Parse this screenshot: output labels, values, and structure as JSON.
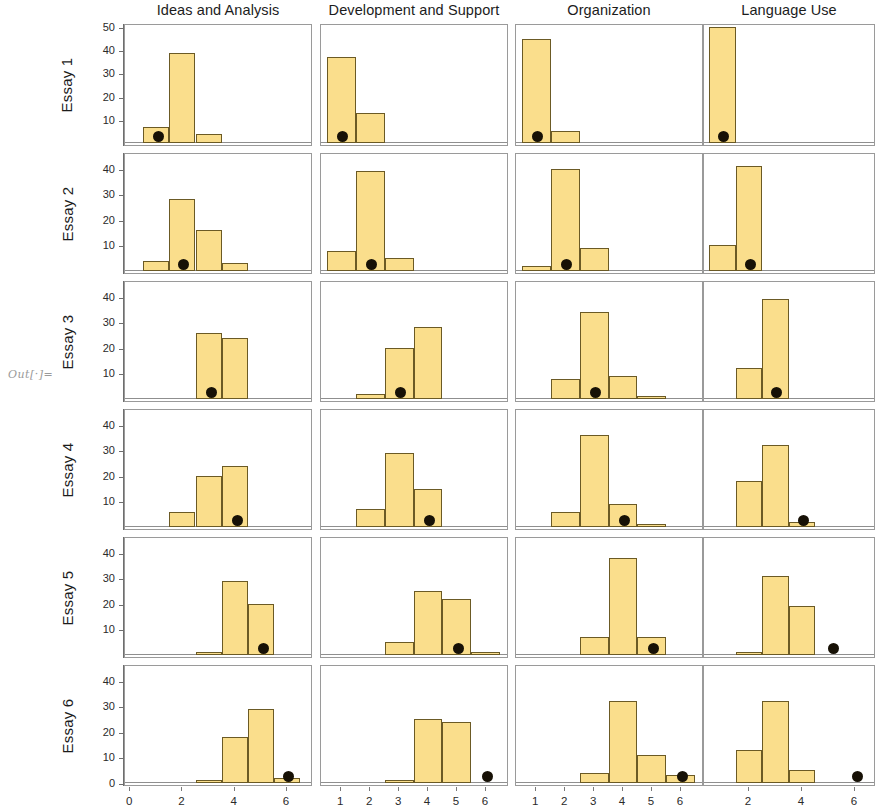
{
  "notebook": {
    "out_prompt": "Out[·]="
  },
  "figure": {
    "column_titles": [
      "Ideas and Analysis",
      "Development and Support",
      "Organization",
      "Language Use"
    ],
    "row_labels": [
      "Essay 1",
      "Essay 2",
      "Essay 3",
      "Essay 4",
      "Essay 5",
      "Essay 6"
    ]
  },
  "chart_data": {
    "type": "bar",
    "title": "",
    "xlabel": "",
    "ylabel": "",
    "grid": false,
    "legend": "none",
    "layout": {
      "rows": 6,
      "cols": 4,
      "row_variable": "Essay",
      "col_variable": "Scoring Domain",
      "marker": "black dot = mean score"
    },
    "panels": [
      {
        "row": "Essay 1",
        "col": "Ideas and Analysis",
        "ylim": [
          0,
          50
        ],
        "yticks": [
          10,
          20,
          30,
          40,
          50
        ],
        "xlim": [
          -0.2,
          7.0
        ],
        "xticks": [
          0,
          2,
          4,
          6
        ],
        "categories": [
          1,
          2,
          3,
          4,
          5,
          6
        ],
        "values": [
          7,
          39,
          4,
          0,
          0,
          0
        ],
        "marker_x": 1.1
      },
      {
        "row": "Essay 1",
        "col": "Development and Support",
        "ylim": [
          0,
          50
        ],
        "yticks": [],
        "xlim": [
          0.3,
          6.8
        ],
        "xticks": [
          1,
          2,
          3,
          4,
          5,
          6
        ],
        "categories": [
          1,
          2,
          3,
          4,
          5,
          6
        ],
        "values": [
          37,
          13,
          0,
          0,
          0,
          0
        ],
        "marker_x": 1.05
      },
      {
        "row": "Essay 1",
        "col": "Organization",
        "ylim": [
          0,
          50
        ],
        "yticks": [],
        "xlim": [
          0.3,
          6.8
        ],
        "xticks": [
          1,
          2,
          3,
          4,
          5,
          6
        ],
        "categories": [
          1,
          2,
          3,
          4,
          5,
          6
        ],
        "values": [
          45,
          5,
          0,
          0,
          0,
          0
        ],
        "marker_x": 1.05
      },
      {
        "row": "Essay 1",
        "col": "Language Use",
        "ylim": [
          0,
          50
        ],
        "yticks": [],
        "xlim": [
          0.3,
          6.8
        ],
        "xticks": [
          2,
          4,
          6
        ],
        "categories": [
          1,
          2,
          3,
          4,
          5,
          6
        ],
        "values": [
          50,
          0,
          0,
          0,
          0,
          0
        ],
        "marker_x": 1.05
      },
      {
        "row": "Essay 2",
        "col": "Ideas and Analysis",
        "ylim": [
          0,
          45
        ],
        "yticks": [
          10,
          20,
          30,
          40
        ],
        "xlim": [
          -0.2,
          7.0
        ],
        "xticks": [
          0,
          2,
          4,
          6
        ],
        "categories": [
          1,
          2,
          3,
          4,
          5,
          6
        ],
        "values": [
          4,
          28,
          16,
          3,
          0,
          0
        ],
        "marker_x": 2.05
      },
      {
        "row": "Essay 2",
        "col": "Development and Support",
        "ylim": [
          0,
          45
        ],
        "yticks": [],
        "xlim": [
          0.3,
          6.8
        ],
        "xticks": [
          1,
          2,
          3,
          4,
          5,
          6
        ],
        "categories": [
          1,
          2,
          3,
          4,
          5,
          6
        ],
        "values": [
          8,
          39,
          5,
          0,
          0,
          0
        ],
        "marker_x": 2.05
      },
      {
        "row": "Essay 2",
        "col": "Organization",
        "ylim": [
          0,
          45
        ],
        "yticks": [],
        "xlim": [
          0.3,
          6.8
        ],
        "xticks": [
          1,
          2,
          3,
          4,
          5,
          6
        ],
        "categories": [
          1,
          2,
          3,
          4,
          5,
          6
        ],
        "values": [
          2,
          40,
          9,
          0,
          0,
          0
        ],
        "marker_x": 2.05
      },
      {
        "row": "Essay 2",
        "col": "Language Use",
        "ylim": [
          0,
          45
        ],
        "yticks": [],
        "xlim": [
          0.3,
          6.8
        ],
        "xticks": [
          2,
          4,
          6
        ],
        "categories": [
          1,
          2,
          3,
          4,
          5,
          6
        ],
        "values": [
          10,
          41,
          0,
          0,
          0,
          0
        ],
        "marker_x": 2.05
      },
      {
        "row": "Essay 3",
        "col": "Ideas and Analysis",
        "ylim": [
          0,
          45
        ],
        "yticks": [
          10,
          20,
          30,
          40
        ],
        "xlim": [
          -0.2,
          7.0
        ],
        "xticks": [
          0,
          2,
          4,
          6
        ],
        "categories": [
          1,
          2,
          3,
          4,
          5,
          6
        ],
        "values": [
          0,
          0,
          26,
          24,
          0,
          0
        ],
        "marker_x": 3.1
      },
      {
        "row": "Essay 3",
        "col": "Development and Support",
        "ylim": [
          0,
          45
        ],
        "yticks": [],
        "xlim": [
          0.3,
          6.8
        ],
        "xticks": [
          1,
          2,
          3,
          4,
          5,
          6
        ],
        "categories": [
          1,
          2,
          3,
          4,
          5,
          6
        ],
        "values": [
          0,
          2,
          20,
          28,
          0,
          0
        ],
        "marker_x": 3.05
      },
      {
        "row": "Essay 3",
        "col": "Organization",
        "ylim": [
          0,
          45
        ],
        "yticks": [],
        "xlim": [
          0.3,
          6.8
        ],
        "xticks": [
          1,
          2,
          3,
          4,
          5,
          6
        ],
        "categories": [
          1,
          2,
          3,
          4,
          5,
          6
        ],
        "values": [
          0,
          8,
          34,
          9,
          1,
          0
        ],
        "marker_x": 3.05
      },
      {
        "row": "Essay 3",
        "col": "Language Use",
        "ylim": [
          0,
          45
        ],
        "yticks": [],
        "xlim": [
          0.3,
          6.8
        ],
        "xticks": [
          2,
          4,
          6
        ],
        "categories": [
          1,
          2,
          3,
          4,
          5,
          6
        ],
        "values": [
          0,
          12,
          39,
          0,
          0,
          0
        ],
        "marker_x": 3.05
      },
      {
        "row": "Essay 4",
        "col": "Ideas and Analysis",
        "ylim": [
          0,
          45
        ],
        "yticks": [
          10,
          20,
          30,
          40
        ],
        "xlim": [
          -0.2,
          7.0
        ],
        "xticks": [
          0,
          2,
          4,
          6
        ],
        "categories": [
          1,
          2,
          3,
          4,
          5,
          6
        ],
        "values": [
          0,
          6,
          20,
          24,
          0,
          0
        ],
        "marker_x": 4.1
      },
      {
        "row": "Essay 4",
        "col": "Development and Support",
        "ylim": [
          0,
          45
        ],
        "yticks": [],
        "xlim": [
          0.3,
          6.8
        ],
        "xticks": [
          1,
          2,
          3,
          4,
          5,
          6
        ],
        "categories": [
          1,
          2,
          3,
          4,
          5,
          6
        ],
        "values": [
          0,
          7,
          29,
          15,
          0,
          0
        ],
        "marker_x": 4.05
      },
      {
        "row": "Essay 4",
        "col": "Organization",
        "ylim": [
          0,
          45
        ],
        "yticks": [],
        "xlim": [
          0.3,
          6.8
        ],
        "xticks": [
          1,
          2,
          3,
          4,
          5,
          6
        ],
        "categories": [
          1,
          2,
          3,
          4,
          5,
          6
        ],
        "values": [
          0,
          6,
          36,
          9,
          1,
          0
        ],
        "marker_x": 4.05
      },
      {
        "row": "Essay 4",
        "col": "Language Use",
        "ylim": [
          0,
          45
        ],
        "yticks": [],
        "xlim": [
          0.3,
          6.8
        ],
        "xticks": [
          2,
          4,
          6
        ],
        "categories": [
          1,
          2,
          3,
          4,
          5,
          6
        ],
        "values": [
          0,
          18,
          32,
          2,
          0,
          0
        ],
        "marker_x": 4.05
      },
      {
        "row": "Essay 5",
        "col": "Ideas and Analysis",
        "ylim": [
          0,
          45
        ],
        "yticks": [
          10,
          20,
          30,
          40
        ],
        "xlim": [
          -0.2,
          7.0
        ],
        "xticks": [
          0,
          2,
          4,
          6
        ],
        "categories": [
          1,
          2,
          3,
          4,
          5,
          6
        ],
        "values": [
          0,
          0,
          1,
          29,
          20,
          0
        ],
        "marker_x": 5.1
      },
      {
        "row": "Essay 5",
        "col": "Development and Support",
        "ylim": [
          0,
          45
        ],
        "yticks": [],
        "xlim": [
          0.3,
          6.8
        ],
        "xticks": [
          1,
          2,
          3,
          4,
          5,
          6
        ],
        "categories": [
          1,
          2,
          3,
          4,
          5,
          6
        ],
        "values": [
          0,
          0,
          5,
          25,
          22,
          1
        ],
        "marker_x": 5.05
      },
      {
        "row": "Essay 5",
        "col": "Organization",
        "ylim": [
          0,
          45
        ],
        "yticks": [],
        "xlim": [
          0.3,
          6.8
        ],
        "xticks": [
          1,
          2,
          3,
          4,
          5,
          6
        ],
        "categories": [
          1,
          2,
          3,
          4,
          5,
          6
        ],
        "values": [
          0,
          0,
          7,
          38,
          7,
          0
        ],
        "marker_x": 5.05
      },
      {
        "row": "Essay 5",
        "col": "Language Use",
        "ylim": [
          0,
          45
        ],
        "yticks": [],
        "xlim": [
          0.3,
          6.8
        ],
        "xticks": [
          2,
          4,
          6
        ],
        "categories": [
          1,
          2,
          3,
          4,
          5,
          6
        ],
        "values": [
          0,
          1,
          31,
          19,
          0,
          0
        ],
        "marker_x": 5.2
      },
      {
        "row": "Essay 6",
        "col": "Ideas and Analysis",
        "ylim": [
          0,
          45
        ],
        "yticks": [
          0,
          10,
          20,
          30,
          40
        ],
        "xlim": [
          -0.2,
          7.0
        ],
        "xticks": [
          0,
          2,
          4,
          6
        ],
        "categories": [
          1,
          2,
          3,
          4,
          5,
          6
        ],
        "values": [
          0,
          0,
          1,
          18,
          29,
          2
        ],
        "marker_x": 6.05
      },
      {
        "row": "Essay 6",
        "col": "Development and Support",
        "ylim": [
          0,
          45
        ],
        "yticks": [],
        "xlim": [
          0.3,
          6.8
        ],
        "xticks": [
          1,
          2,
          3,
          4,
          5,
          6
        ],
        "categories": [
          1,
          2,
          3,
          4,
          5,
          6
        ],
        "values": [
          0,
          0,
          1,
          25,
          24,
          0
        ],
        "marker_x": 6.05
      },
      {
        "row": "Essay 6",
        "col": "Organization",
        "ylim": [
          0,
          45
        ],
        "yticks": [],
        "xlim": [
          0.3,
          6.8
        ],
        "xticks": [
          1,
          2,
          3,
          4,
          5,
          6
        ],
        "categories": [
          1,
          2,
          3,
          4,
          5,
          6
        ],
        "values": [
          0,
          0,
          4,
          32,
          11,
          3
        ],
        "marker_x": 6.05
      },
      {
        "row": "Essay 6",
        "col": "Language Use",
        "ylim": [
          0,
          45
        ],
        "yticks": [],
        "xlim": [
          0.3,
          6.8
        ],
        "xticks": [
          2,
          4,
          6
        ],
        "categories": [
          1,
          2,
          3,
          4,
          5,
          6
        ],
        "values": [
          0,
          13,
          32,
          5,
          0,
          0
        ],
        "marker_x": 6.1
      }
    ],
    "colors": {
      "bar_fill": "#fade8c",
      "bar_edge": "#6b5a25",
      "marker": "#171106",
      "frame": "#9a9a9a",
      "axis": "#6e6e6e"
    }
  }
}
